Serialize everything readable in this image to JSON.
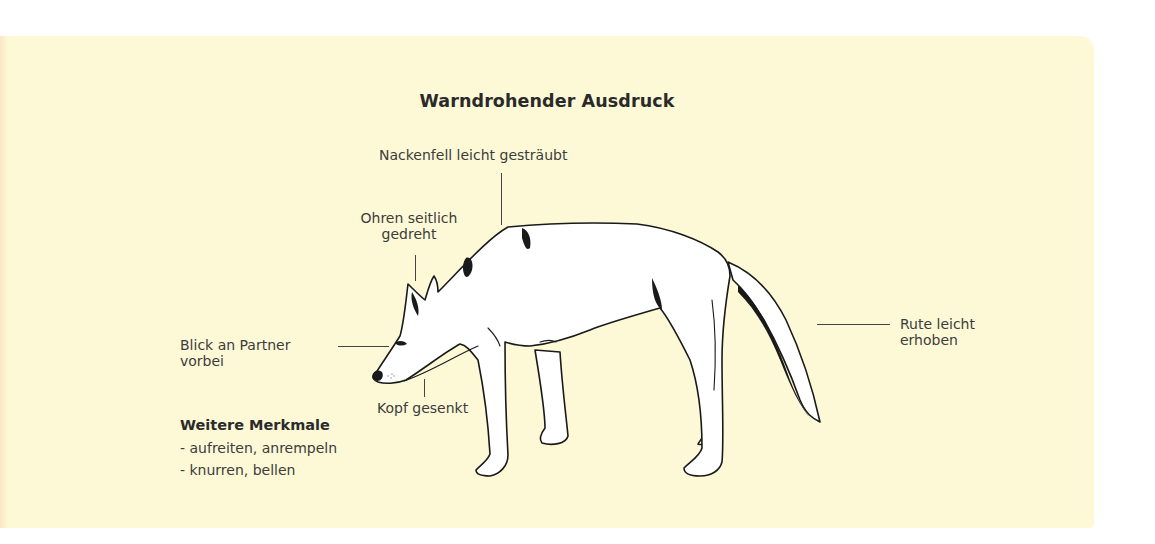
{
  "diagram": {
    "title": "Warndrohender Ausdruck",
    "annotations": {
      "nackenfell": "Nackenfell leicht gesträubt",
      "ohren_line1": "Ohren seitlich",
      "ohren_line2": "gedreht",
      "blick_line1": "Blick an Partner",
      "blick_line2": "vorbei",
      "kopf": "Kopf gesenkt",
      "rute_line1": "Rute leicht",
      "rute_line2": "erhoben"
    },
    "further_features": {
      "heading": "Weitere Merkmale",
      "items": [
        "- aufreiten, anrempeln",
        "- knurren, bellen"
      ]
    },
    "colors": {
      "panel_background": "#fdf9d6",
      "text": "#3c3c3c",
      "outline": "#1a1a1a"
    }
  }
}
